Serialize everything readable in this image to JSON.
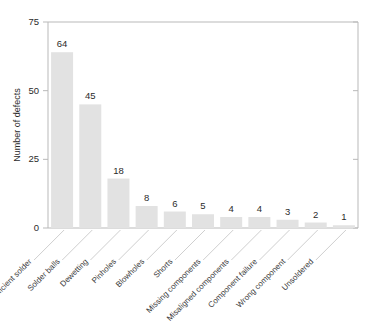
{
  "chart_data": {
    "type": "bar",
    "title": "",
    "xlabel": "",
    "ylabel": "Number of defects",
    "ylim": [
      0,
      75
    ],
    "yticks": [
      0,
      25,
      50,
      75
    ],
    "grid": false,
    "legend": false,
    "bar_color": "#e2e2e2",
    "categories": [
      "Insufficient solder",
      "Solder balls",
      "Dewetting",
      "Pinholes",
      "Blowholes",
      "Shorts",
      "Missing components",
      "Misaligned components",
      "Component failure",
      "Wrong component",
      "Unsoldered"
    ],
    "values": [
      64,
      45,
      18,
      8,
      6,
      5,
      4,
      4,
      3,
      2,
      1
    ],
    "value_labels": [
      "64",
      "45",
      "18",
      "8",
      "6",
      "5",
      "4",
      "4",
      "3",
      "2",
      "1"
    ],
    "ytick_labels": [
      "0",
      "25",
      "50",
      "75"
    ]
  }
}
